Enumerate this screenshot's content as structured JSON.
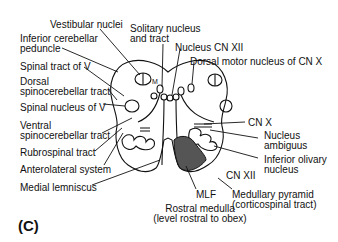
{
  "figure": {
    "panel_label": "(C)",
    "caption_line1": "Rostral medulla",
    "caption_line2": "(level rostral to obex)"
  },
  "labels_left": [
    {
      "id": "vestibular-nuclei",
      "text": "Vestibular nuclei"
    },
    {
      "id": "inferior-cerebellar-peduncle-1",
      "text": "Inferior cerebellar"
    },
    {
      "id": "inferior-cerebellar-peduncle-2",
      "text": "peduncle"
    },
    {
      "id": "spinal-tract-v",
      "text": "Spinal tract of V"
    },
    {
      "id": "dorsal-spinocerebellar-1",
      "text": "Dorsal"
    },
    {
      "id": "dorsal-spinocerebellar-2",
      "text": "spinocerebellar tract"
    },
    {
      "id": "spinal-nucleus-v",
      "text": "Spinal nucleus of V"
    },
    {
      "id": "ventral-spinocerebellar-1",
      "text": "Ventral"
    },
    {
      "id": "ventral-spinocerebellar-2",
      "text": "spinocerebellar tract"
    },
    {
      "id": "rubrospinal",
      "text": "Rubrospinal tract"
    },
    {
      "id": "anterolateral",
      "text": "Anterolateral system"
    },
    {
      "id": "medial-lemniscus",
      "text": "Medial lemniscus"
    }
  ],
  "labels_top": [
    {
      "id": "solitary-1",
      "text": "Solitary nucleus"
    },
    {
      "id": "solitary-2",
      "text": "and tract"
    },
    {
      "id": "nucleus-cn-xii",
      "text": "Nucleus CN XII"
    },
    {
      "id": "dorsal-motor-x",
      "text": "Dorsal motor nucleus of CN X"
    }
  ],
  "labels_right": [
    {
      "id": "cn-x",
      "text": "CN X"
    },
    {
      "id": "nucleus-ambiguus-1",
      "text": "Nucleus"
    },
    {
      "id": "nucleus-ambiguus-2",
      "text": "ambiguus"
    },
    {
      "id": "inferior-olivary-1",
      "text": "Inferior olivary"
    },
    {
      "id": "inferior-olivary-2",
      "text": "nucleus"
    },
    {
      "id": "cn-xii",
      "text": "CN XII"
    },
    {
      "id": "mlf",
      "text": "MLF"
    },
    {
      "id": "medullary-pyramid-1",
      "text": "Medullary pyramid"
    },
    {
      "id": "medullary-pyramid-2",
      "text": "(corticospinal tract)"
    }
  ],
  "vestibular_marks": {
    "l": "l",
    "m": "M"
  },
  "colors": {
    "line": "#111111",
    "pyramid_fill": "#555555"
  }
}
